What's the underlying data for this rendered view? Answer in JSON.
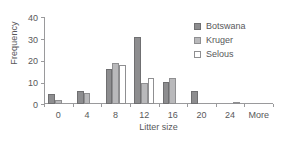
{
  "chart_data": {
    "type": "bar",
    "title": "",
    "xlabel": "Litter size",
    "ylabel": "Frequency",
    "categories": [
      "0",
      "4",
      "8",
      "12",
      "16",
      "20",
      "24",
      "More"
    ],
    "series": [
      {
        "name": "Botswana",
        "color": "#8d8d8f",
        "values": [
          4.5,
          6,
          16,
          31,
          10,
          6,
          0,
          0
        ]
      },
      {
        "name": "Kruger",
        "color": "#b9b9bb",
        "values": [
          2,
          5,
          19,
          9.5,
          12,
          0,
          0,
          0
        ]
      },
      {
        "name": "Selous",
        "color": "#ffffff",
        "values": [
          0,
          0,
          18,
          12,
          0,
          0,
          1,
          0
        ]
      }
    ],
    "ylim": [
      0,
      40
    ],
    "yticks": [
      0,
      10,
      20,
      30,
      40
    ],
    "ytick_labels": [
      "0",
      "10",
      "20",
      "30",
      "40"
    ],
    "grid": false,
    "legend_position": "top-right"
  },
  "axis": {
    "line_color": "#9a9a9c",
    "text_color": "#58585a"
  }
}
